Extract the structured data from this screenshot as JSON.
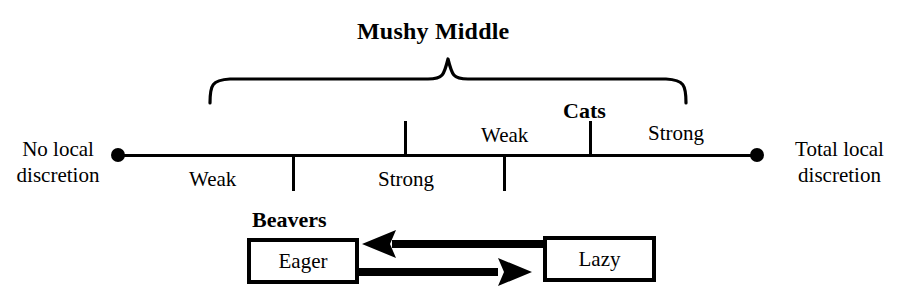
{
  "diagram": {
    "title": "Mushy Middle",
    "bracket_label": "Mushy Middle",
    "axis": {
      "left_endpoint_label_line1": "No local",
      "left_endpoint_label_line2": "discretion",
      "right_endpoint_label_line1": "Total local",
      "right_endpoint_label_line2": "discretion",
      "segment_labels_below": [
        "Weak",
        "Strong"
      ],
      "segment_labels_above": [
        "Weak",
        "Strong"
      ],
      "marker_label": "Cats"
    },
    "segments": [
      {
        "label": "Weak",
        "position": "below",
        "center_x": 215
      },
      {
        "label": "Strong",
        "position": "below",
        "center_x": 411
      },
      {
        "label": "Weak",
        "position": "above",
        "center_x": 508
      },
      {
        "label": "Strong",
        "position": "above",
        "center_x": 681
      }
    ],
    "ticks": [
      {
        "x": 293,
        "direction": "down"
      },
      {
        "x": 405,
        "direction": "up"
      },
      {
        "x": 504,
        "direction": "down"
      },
      {
        "x": 590,
        "direction": "up",
        "label": "Cats"
      }
    ],
    "beavers": {
      "group_label": "Beavers",
      "boxes": [
        {
          "label": "Eager"
        },
        {
          "label": "Lazy"
        }
      ],
      "arrows": [
        {
          "from": "Lazy",
          "to": "Eager",
          "direction": "left"
        },
        {
          "from": "Eager",
          "to": "Lazy",
          "direction": "right"
        }
      ]
    },
    "colors": {
      "ink": "#000000",
      "background": "#ffffff"
    }
  }
}
